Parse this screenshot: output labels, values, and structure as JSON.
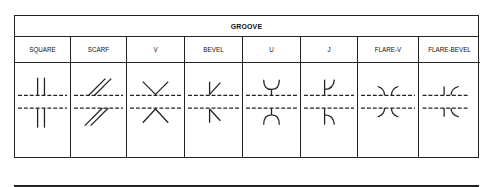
{
  "table": {
    "title": "GROOVE",
    "columns": [
      {
        "label": "SQUARE",
        "symbol": "square-groove-icon"
      },
      {
        "label": "SCARF",
        "symbol": "scarf-groove-icon"
      },
      {
        "label": "V",
        "symbol": "v-groove-icon"
      },
      {
        "label": "BEVEL",
        "symbol": "bevel-groove-icon"
      },
      {
        "label": "U",
        "symbol": "u-groove-icon"
      },
      {
        "label": "J",
        "symbol": "j-groove-icon"
      },
      {
        "label": "FLARE-V",
        "symbol": "flare-v-groove-icon"
      },
      {
        "label": "FLARE-BEVEL",
        "symbol": "flare-bevel-groove-icon"
      }
    ]
  },
  "colors": {
    "line": "#222222",
    "background": "#ffffff"
  }
}
